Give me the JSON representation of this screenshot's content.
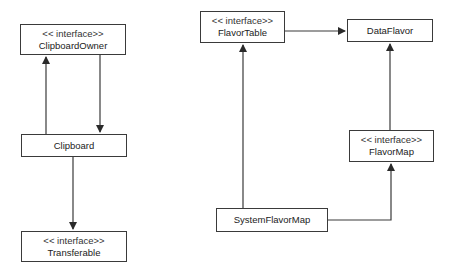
{
  "diagram": {
    "type": "uml-class-diagram",
    "nodes": [
      {
        "id": "clipboard_owner",
        "stereotype": "<< interface>>",
        "name": "ClipboardOwner"
      },
      {
        "id": "clipboard",
        "stereotype": "",
        "name": "Clipboard"
      },
      {
        "id": "transferable",
        "stereotype": "<< interface>>",
        "name": "Transferable"
      },
      {
        "id": "flavor_table",
        "stereotype": "<< interface>>",
        "name": "FlavorTable"
      },
      {
        "id": "data_flavor",
        "stereotype": "",
        "name": "DataFlavor"
      },
      {
        "id": "flavor_map",
        "stereotype": "<< interface>>",
        "name": "FlavorMap"
      },
      {
        "id": "system_flavor_map",
        "stereotype": "",
        "name": "SystemFlavorMap"
      }
    ],
    "edges": [
      {
        "from": "Clipboard",
        "to": "ClipboardOwner"
      },
      {
        "from": "ClipboardOwner",
        "to": "Clipboard"
      },
      {
        "from": "Clipboard",
        "to": "Transferable"
      },
      {
        "from": "FlavorTable",
        "to": "DataFlavor"
      },
      {
        "from": "SystemFlavorMap",
        "to": "FlavorTable"
      },
      {
        "from": "FlavorMap",
        "to": "DataFlavor"
      },
      {
        "from": "SystemFlavorMap",
        "to": "FlavorMap"
      }
    ],
    "colors": {
      "line": "#3a3a3a",
      "background": "#ffffff",
      "text": "#222222"
    }
  }
}
